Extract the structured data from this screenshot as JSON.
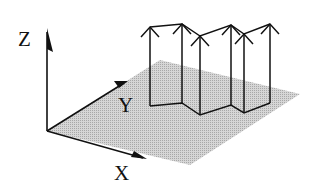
{
  "diagram": {
    "type": "3d-coordinate-figure",
    "axes": {
      "x": {
        "label": "X"
      },
      "y": {
        "label": "Y"
      },
      "z": {
        "label": "Z"
      }
    },
    "plane": {
      "fill": "#c8c8c8",
      "description": "shaded XY ground plane"
    },
    "wall": {
      "description": "zig-zag vertical wall standing on the plane with upward arrows at each vertex",
      "vertex_count": 6,
      "arrows": "upward"
    },
    "colors": {
      "line": "#111111",
      "plane": "#c8c8c8",
      "background": "#ffffff"
    }
  }
}
